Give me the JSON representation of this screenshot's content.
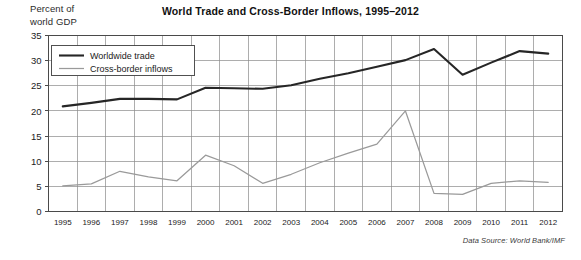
{
  "chart_data": {
    "type": "line",
    "title": "World Trade and Cross-Border Inflows, 1995–2012",
    "xlabel": "",
    "ylabel": "Percent of\nworld GDP",
    "categories": [
      "1995",
      "1996",
      "1997",
      "1998",
      "1999",
      "2000",
      "2001",
      "2002",
      "2003",
      "2004",
      "2005",
      "2006",
      "2007",
      "2008",
      "2009",
      "2010",
      "2011",
      "2012"
    ],
    "x": [
      1995,
      1996,
      1997,
      1998,
      1999,
      2000,
      2001,
      2002,
      2003,
      2004,
      2005,
      2006,
      2007,
      2008,
      2009,
      2010,
      2011,
      2012
    ],
    "series": [
      {
        "name": "Worldwide trade",
        "color": "#262626",
        "values": [
          20.9,
          21.6,
          22.4,
          22.4,
          22.3,
          24.6,
          24.5,
          24.4,
          25.1,
          26.4,
          27.5,
          28.8,
          30.1,
          32.3,
          27.2,
          29.6,
          31.9,
          31.4
        ]
      },
      {
        "name": "Cross-border inflows",
        "color": "#9a9a9a",
        "values": [
          5.1,
          5.5,
          8.0,
          6.9,
          6.1,
          11.2,
          9.1,
          5.6,
          7.4,
          9.7,
          11.6,
          13.4,
          20.0,
          3.6,
          3.4,
          5.6,
          6.1,
          5.8
        ]
      }
    ],
    "ylim": [
      0,
      35
    ],
    "yticks": [
      0,
      5,
      10,
      15,
      20,
      25,
      30,
      35
    ],
    "ytick_labels": [
      "0",
      "5",
      "10",
      "15",
      "20",
      "25",
      "30",
      "35"
    ],
    "grid": true,
    "legend_position": "upper-left-inside",
    "source_note": "Data Source: World Bank/IMF"
  },
  "legend": {
    "entries": [
      {
        "label": "Worldwide trade"
      },
      {
        "label": "Cross-border inflows"
      }
    ]
  }
}
